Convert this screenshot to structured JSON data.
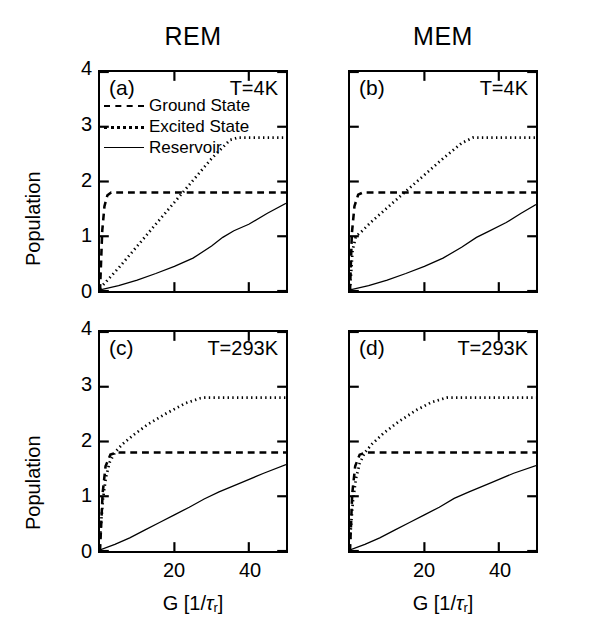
{
  "figure": {
    "column_titles": [
      "REM",
      "MEM"
    ],
    "ylabel": "Population",
    "xlabel_main": "G [1/",
    "xlabel_tau": "τ",
    "xlabel_sub": "r",
    "xlabel_close": "]",
    "xlabel_full": "G [1/τr]"
  },
  "legend": {
    "items": [
      {
        "label": "Ground  State",
        "style": "dashed"
      },
      {
        "label": "Excited  State",
        "style": "dotted"
      },
      {
        "label": "Reservoir",
        "style": "solid"
      }
    ]
  },
  "axes": {
    "y_ticks": [
      "0",
      "1",
      "2",
      "3",
      "4"
    ],
    "x_ticks": [
      "20",
      "40"
    ],
    "ylim": [
      0,
      4
    ],
    "xlim": [
      0,
      50
    ]
  },
  "panels": [
    {
      "tag": "(a)",
      "temperature": "T=4K",
      "column": "REM"
    },
    {
      "tag": "(b)",
      "temperature": "T=4K",
      "column": "MEM"
    },
    {
      "tag": "(c)",
      "temperature": "T=293K",
      "column": "REM"
    },
    {
      "tag": "(d)",
      "temperature": "T=293K",
      "column": "MEM"
    }
  ],
  "chart_data": {
    "type": "line",
    "xlabel": "G [1/τr]",
    "ylabel": "Population",
    "xlim": [
      0,
      50
    ],
    "ylim": [
      0,
      4
    ],
    "xticks": [
      20,
      40
    ],
    "yticks": [
      0,
      1,
      2,
      3,
      4
    ],
    "grid": false,
    "legend_position": "upper-left-panel-a",
    "panels": [
      {
        "id": "a",
        "label": "(a)",
        "annotation": "T=4K",
        "model": "REM",
        "series": [
          {
            "name": "Ground State",
            "style": "dashed",
            "x": [
              0,
              0.6,
              1.2,
              2.0,
              3.0,
              50
            ],
            "y": [
              0.0,
              1.1,
              1.55,
              1.75,
              1.8,
              1.8
            ]
          },
          {
            "name": "Excited State",
            "style": "dotted",
            "x": [
              0,
              5,
              10,
              15,
              20,
              25,
              30,
              35,
              37,
              42,
              50
            ],
            "y": [
              0.05,
              0.42,
              0.82,
              1.22,
              1.62,
              2.02,
              2.42,
              2.76,
              2.8,
              2.8,
              2.8
            ]
          },
          {
            "name": "Reservoir",
            "style": "solid",
            "x": [
              0,
              5,
              10,
              15,
              20,
              25,
              30,
              33,
              36,
              40,
              45,
              50
            ],
            "y": [
              0.02,
              0.1,
              0.2,
              0.32,
              0.45,
              0.6,
              0.82,
              0.98,
              1.1,
              1.22,
              1.42,
              1.6
            ]
          }
        ]
      },
      {
        "id": "b",
        "label": "(b)",
        "annotation": "T=4K",
        "model": "MEM",
        "series": [
          {
            "name": "Ground State",
            "style": "dashed",
            "x": [
              0,
              0.5,
              1.2,
              2.2,
              3.5,
              50
            ],
            "y": [
              0.0,
              1.05,
              1.55,
              1.76,
              1.8,
              1.8
            ]
          },
          {
            "name": "Excited State",
            "style": "dotted",
            "x": [
              0,
              0.7,
              1.6,
              3.0,
              6,
              10,
              15,
              20,
              25,
              30,
              33,
              38,
              50
            ],
            "y": [
              0.02,
              0.75,
              1.0,
              1.08,
              1.28,
              1.52,
              1.82,
              2.12,
              2.42,
              2.7,
              2.8,
              2.8,
              2.8
            ]
          },
          {
            "name": "Reservoir",
            "style": "solid",
            "x": [
              0,
              5,
              10,
              15,
              20,
              25,
              30,
              34,
              37,
              42,
              46,
              50
            ],
            "y": [
              0.02,
              0.1,
              0.2,
              0.32,
              0.45,
              0.6,
              0.8,
              0.98,
              1.08,
              1.25,
              1.42,
              1.58
            ]
          }
        ]
      },
      {
        "id": "c",
        "label": "(c)",
        "annotation": "T=293K",
        "model": "REM",
        "series": [
          {
            "name": "Ground State",
            "style": "dashed",
            "x": [
              0,
              0.7,
              1.5,
              2.8,
              4.5,
              50
            ],
            "y": [
              0.0,
              1.05,
              1.55,
              1.76,
              1.8,
              1.8
            ]
          },
          {
            "name": "Excited State",
            "style": "dotted",
            "x": [
              0,
              0.8,
              1.6,
              2.6,
              4,
              6,
              9,
              13,
              18,
              23,
              27,
              28,
              35,
              50
            ],
            "y": [
              0.25,
              0.95,
              1.35,
              1.62,
              1.8,
              1.95,
              2.12,
              2.32,
              2.52,
              2.7,
              2.79,
              2.8,
              2.8,
              2.8
            ]
          },
          {
            "name": "Reservoir",
            "style": "solid",
            "x": [
              0,
              4,
              8,
              12,
              16,
              20,
              24,
              28,
              32,
              38,
              44,
              50
            ],
            "y": [
              0.02,
              0.12,
              0.24,
              0.38,
              0.52,
              0.66,
              0.8,
              0.95,
              1.08,
              1.25,
              1.42,
              1.58
            ]
          }
        ]
      },
      {
        "id": "d",
        "label": "(d)",
        "annotation": "T=293K",
        "model": "MEM",
        "series": [
          {
            "name": "Ground State",
            "style": "dashed",
            "x": [
              0,
              0.6,
              1.4,
              2.6,
              4.2,
              50
            ],
            "y": [
              0.0,
              1.05,
              1.55,
              1.76,
              1.8,
              1.8
            ]
          },
          {
            "name": "Excited State",
            "style": "dotted",
            "x": [
              0,
              0.8,
              1.6,
              2.6,
              4,
              6,
              9,
              13,
              18,
              22,
              26,
              27,
              35,
              50
            ],
            "y": [
              0.22,
              0.92,
              1.32,
              1.6,
              1.8,
              1.96,
              2.15,
              2.36,
              2.58,
              2.72,
              2.8,
              2.8,
              2.8,
              2.8
            ]
          },
          {
            "name": "Reservoir",
            "style": "solid",
            "x": [
              0,
              4,
              8,
              12,
              16,
              20,
              24,
              28,
              32,
              38,
              44,
              50
            ],
            "y": [
              0.02,
              0.12,
              0.24,
              0.38,
              0.52,
              0.66,
              0.8,
              0.96,
              1.08,
              1.25,
              1.42,
              1.56
            ]
          }
        ]
      }
    ]
  }
}
